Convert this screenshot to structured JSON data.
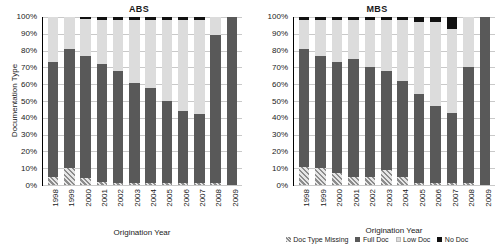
{
  "figure": {
    "ylabel": "Documentation Type",
    "xlabel": "Origination Year",
    "legend": [
      {
        "label": "Doc Type Missing",
        "key": "missing",
        "color": "#9a9a9a"
      },
      {
        "label": "Full Doc",
        "key": "fulldoc",
        "color": "#595959"
      },
      {
        "label": "Low Doc",
        "key": "lowdoc",
        "color": "#dcdcdc"
      },
      {
        "label": "No Doc",
        "key": "nodoc",
        "color": "#111111"
      }
    ],
    "yticks": [
      "100%",
      "90%",
      "80%",
      "70%",
      "60%",
      "50%",
      "40%",
      "30%",
      "20%",
      "10%",
      "0%"
    ]
  },
  "chart_data": [
    {
      "type": "bar",
      "stacked": true,
      "title": "ABS",
      "xlabel": "Origination Year",
      "ylabel": "Documentation Type",
      "ylim": [
        0,
        100
      ],
      "yticks": [
        0,
        10,
        20,
        30,
        40,
        50,
        60,
        70,
        80,
        90,
        100
      ],
      "grid": true,
      "legend_position": "bottom",
      "categories": [
        "1998",
        "1999",
        "2000",
        "2001",
        "2002",
        "2003",
        "2004",
        "2005",
        "2006",
        "2007",
        "2008",
        "2009"
      ],
      "series": [
        {
          "name": "Doc Type Missing",
          "values": [
            5,
            10,
            4,
            2,
            1,
            1,
            1,
            1,
            1,
            1,
            1,
            0
          ]
        },
        {
          "name": "Full Doc",
          "values": [
            68,
            71,
            73,
            70,
            67,
            60,
            57,
            49,
            43,
            41,
            88,
            100
          ]
        },
        {
          "name": "Low Doc",
          "values": [
            27,
            19,
            22,
            26,
            30,
            37,
            40,
            48,
            54,
            56,
            11,
            0
          ]
        },
        {
          "name": "No Doc",
          "values": [
            0,
            0,
            1,
            2,
            2,
            2,
            2,
            2,
            2,
            2,
            0,
            0
          ]
        }
      ],
      "cumulative_full_doc_top": [
        73,
        81,
        77,
        72,
        68,
        61,
        58,
        50,
        44,
        42,
        89,
        100
      ]
    },
    {
      "type": "bar",
      "stacked": true,
      "title": "MBS",
      "xlabel": "Origination Year",
      "ylabel": "Documentation Type",
      "ylim": [
        0,
        100
      ],
      "yticks": [
        0,
        10,
        20,
        30,
        40,
        50,
        60,
        70,
        80,
        90,
        100
      ],
      "grid": true,
      "legend_position": "bottom",
      "categories": [
        "1998",
        "1999",
        "2000",
        "2001",
        "2002",
        "2003",
        "2004",
        "2005",
        "2006",
        "2007",
        "2008",
        "2009"
      ],
      "series": [
        {
          "name": "Doc Type Missing",
          "values": [
            11,
            10,
            7,
            5,
            5,
            9,
            5,
            1,
            1,
            1,
            1,
            0
          ]
        },
        {
          "name": "Full Doc",
          "values": [
            70,
            67,
            66,
            70,
            65,
            59,
            57,
            53,
            46,
            42,
            69,
            100
          ]
        },
        {
          "name": "Low Doc",
          "values": [
            17,
            21,
            25,
            23,
            28,
            30,
            36,
            43,
            50,
            50,
            30,
            0
          ]
        },
        {
          "name": "No Doc",
          "values": [
            2,
            2,
            2,
            2,
            2,
            2,
            2,
            3,
            3,
            7,
            0,
            0
          ]
        }
      ],
      "cumulative_full_doc_top": [
        81,
        77,
        73,
        75,
        70,
        68,
        62,
        54,
        47,
        43,
        70,
        100
      ]
    }
  ]
}
